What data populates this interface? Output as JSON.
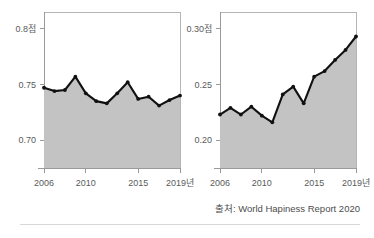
{
  "figure": {
    "source_note": "출처: World Hapiness Report 2020"
  },
  "chart_data": [
    {
      "id": "left",
      "type": "area",
      "title": "",
      "xlabel": "",
      "ylabel": "",
      "x": [
        2006,
        2007,
        2008,
        2009,
        2010,
        2011,
        2012,
        2013,
        2014,
        2015,
        2016,
        2017,
        2018,
        2019
      ],
      "values": [
        0.747,
        0.744,
        0.745,
        0.757,
        0.742,
        0.735,
        0.733,
        0.742,
        0.752,
        0.737,
        0.739,
        0.731,
        0.736,
        0.74
      ],
      "xlim": [
        2006,
        2019
      ],
      "ylim": [
        0.675,
        0.815
      ],
      "ytick_values": [
        0.8,
        0.75,
        0.7
      ],
      "ytick_labels": [
        "0.8점",
        "0.75",
        "0.70"
      ],
      "xtick_values": [
        2006,
        2010,
        2015,
        2019
      ],
      "xtick_labels": [
        "2006",
        "2010",
        "2015",
        "2019년"
      ],
      "grid": false,
      "legend": "none",
      "colors": {
        "line": "#111111",
        "area": "#c3c3c3",
        "frame": "#b5b5b5"
      }
    },
    {
      "id": "right",
      "type": "area",
      "title": "",
      "xlabel": "",
      "ylabel": "",
      "x": [
        2006,
        2007,
        2008,
        2009,
        2010,
        2011,
        2012,
        2013,
        2014,
        2015,
        2016,
        2017,
        2018,
        2019
      ],
      "values": [
        0.223,
        0.229,
        0.223,
        0.23,
        0.222,
        0.216,
        0.241,
        0.248,
        0.233,
        0.257,
        0.262,
        0.272,
        0.281,
        0.293
      ],
      "xlim": [
        2006,
        2019
      ],
      "ylim": [
        0.175,
        0.315
      ],
      "ytick_values": [
        0.3,
        0.25,
        0.2
      ],
      "ytick_labels": [
        "0.30점",
        "0.25",
        "0.20"
      ],
      "xtick_values": [
        2006,
        2010,
        2015,
        2019
      ],
      "xtick_labels": [
        "2006",
        "2010",
        "2015",
        "2019년"
      ],
      "grid": false,
      "legend": "none",
      "colors": {
        "line": "#111111",
        "area": "#c3c3c3",
        "frame": "#b5b5b5"
      }
    }
  ]
}
